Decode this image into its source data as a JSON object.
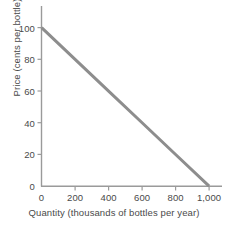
{
  "chart_data": {
    "type": "line",
    "title": "",
    "subtitle": "",
    "xlabel": "Quantity (thousands of bottles per year)",
    "ylabel": "Price (cents per bottle)",
    "xlim": [
      0,
      1050
    ],
    "ylim": [
      0,
      112
    ],
    "grid": false,
    "legend": "none",
    "xticks": [
      {
        "value": 0,
        "label": "0"
      },
      {
        "value": 200,
        "label": "200"
      },
      {
        "value": 400,
        "label": "400"
      },
      {
        "value": 600,
        "label": "600"
      },
      {
        "value": 800,
        "label": "800"
      },
      {
        "value": 1000,
        "label": "1,000"
      }
    ],
    "yticks": [
      {
        "value": 0,
        "label": "0"
      },
      {
        "value": 20,
        "label": "20"
      },
      {
        "value": 40,
        "label": "40"
      },
      {
        "value": 60,
        "label": "60"
      },
      {
        "value": 80,
        "label": "80"
      },
      {
        "value": 100,
        "label": "100"
      }
    ],
    "series": [
      {
        "name": "demand",
        "color": "#8d8d8d",
        "linewidth": 3,
        "x": [
          0,
          200,
          400,
          600,
          800,
          1000
        ],
        "y": [
          100,
          80,
          60,
          40,
          20,
          0
        ]
      }
    ],
    "axis_color": "#9a9a9a",
    "text_color": "#4a4a4a",
    "background": "#ffffff"
  }
}
